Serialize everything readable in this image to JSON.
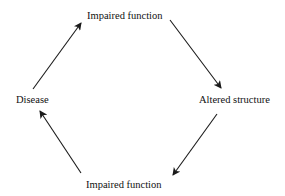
{
  "diagram": {
    "type": "cycle",
    "nodes": [
      {
        "id": "top",
        "label": "Impaired function"
      },
      {
        "id": "right",
        "label": "Altered structure"
      },
      {
        "id": "bottom",
        "label": "Impaired function"
      },
      {
        "id": "left",
        "label": "Disease"
      }
    ],
    "edges": [
      {
        "from": "left",
        "to": "top"
      },
      {
        "from": "top",
        "to": "right"
      },
      {
        "from": "right",
        "to": "bottom"
      },
      {
        "from": "bottom",
        "to": "left"
      }
    ],
    "colors": {
      "ink": "#1a1a1a",
      "background": "#ffffff"
    }
  }
}
